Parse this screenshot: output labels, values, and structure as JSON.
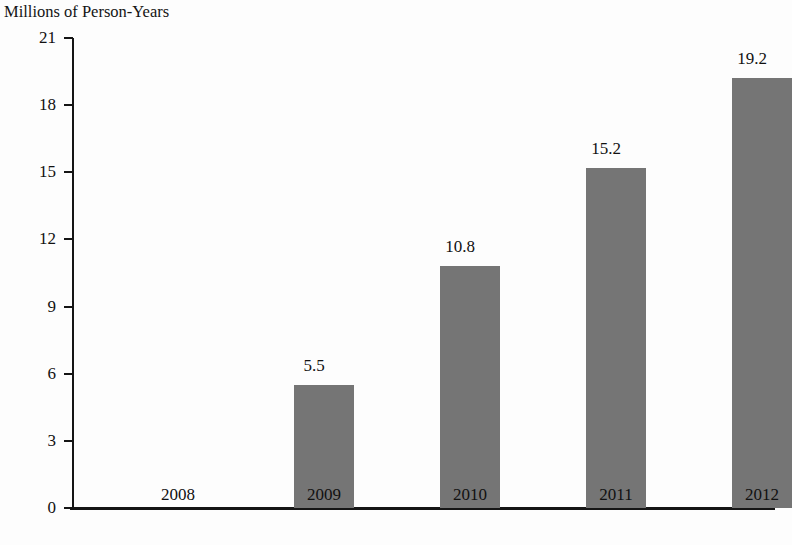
{
  "chart_data": {
    "type": "bar",
    "title": "",
    "axis_label": "Millions of Person-Years",
    "xlabel": "",
    "ylabel": "Millions of Person-Years",
    "categories": [
      "2008",
      "2009",
      "2010",
      "2011",
      "2012"
    ],
    "values": [
      null,
      5.5,
      10.8,
      15.2,
      19.2
    ],
    "value_labels": [
      "",
      "5.5",
      "10.8",
      "15.2",
      "19.2"
    ],
    "ylim": [
      0,
      21
    ],
    "yticks": [
      0,
      3,
      6,
      9,
      12,
      15,
      18,
      21
    ],
    "ytick_labels": [
      "0",
      "3",
      "6",
      "9",
      "12",
      "15",
      "18",
      "21"
    ],
    "grid": false,
    "legend": false,
    "bar_color": "#757575",
    "axis_color": "#151515",
    "background_color": "#fdfdfd"
  }
}
